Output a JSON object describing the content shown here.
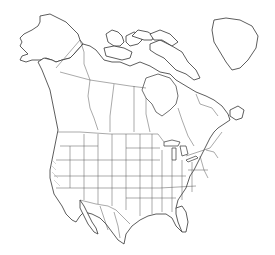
{
  "map": {
    "title": "North America outline map",
    "region": "North America",
    "labels": [],
    "style": {
      "background": "#ffffff",
      "line_color": "#333333",
      "land_fill": "#ffffff"
    },
    "regions": [
      "Alaska",
      "Canada",
      "Greenland (partial)",
      "United States",
      "Mexico"
    ]
  }
}
